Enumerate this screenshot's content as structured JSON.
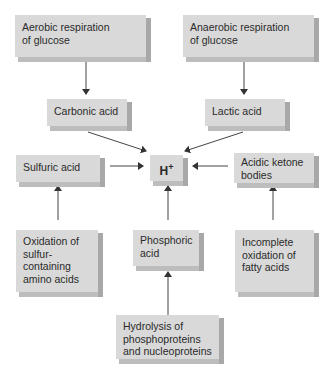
{
  "diagram": {
    "nodes": {
      "aerobic": "Aerobic respiration\nof glucose",
      "anaerobic": "Anaerobic respiration\nof glucose",
      "carbonic": "Carbonic acid",
      "lactic": "Lactic acid",
      "sulfuric": "Sulfuric acid",
      "hplus": "H",
      "hplus_sup": "+",
      "ketone": "Acidic ketone\nbodies",
      "oxidation_sulfur": "Oxidation of\nsulfur-\ncontaining\namino acids",
      "phosphoric": "Phosphoric\nacid",
      "incomplete": "Incomplete\noxidation of\nfatty acids",
      "hydrolysis": "Hydrolysis of\nphosphoproteins\nand nucleoproteins"
    },
    "edges": [
      [
        "aerobic",
        "carbonic"
      ],
      [
        "anaerobic",
        "lactic"
      ],
      [
        "carbonic",
        "hplus"
      ],
      [
        "lactic",
        "hplus"
      ],
      [
        "sulfuric",
        "hplus"
      ],
      [
        "ketone",
        "hplus"
      ],
      [
        "phosphoric",
        "hplus"
      ],
      [
        "oxidation_sulfur",
        "sulfuric"
      ],
      [
        "incomplete",
        "ketone"
      ],
      [
        "hydrolysis",
        "phosphoric"
      ]
    ],
    "colors": {
      "box_face": "#d9d9d9",
      "box_side": "#a8a8a8",
      "arrow": "#333333"
    }
  }
}
